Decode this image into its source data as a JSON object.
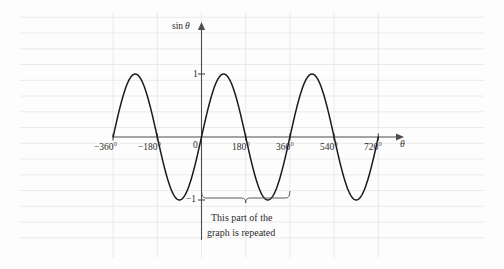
{
  "chart_data": {
    "type": "line",
    "title": "",
    "subtitle": "",
    "xlabel": "θ",
    "ylabel": "sin θ",
    "xlim": [
      -360,
      720
    ],
    "ylim": [
      -1,
      1
    ],
    "grid": true,
    "legend": null,
    "function": "y = sin(theta)",
    "amplitude": 1,
    "period_degrees": 360,
    "x_ticks": [
      -360,
      -180,
      0,
      180,
      360,
      540,
      720
    ],
    "x_tick_labels": [
      "−360°",
      "−180°",
      "0",
      "180°",
      "360°",
      "540°",
      "720°"
    ],
    "y_ticks": [
      1,
      -1
    ],
    "y_tick_labels": [
      "1",
      "−1"
    ],
    "series": [
      {
        "name": "sin θ",
        "color": "#1a1a1a",
        "x": [
          -360,
          -330,
          -300,
          -270,
          -240,
          -210,
          -180,
          -150,
          -120,
          -90,
          -60,
          -30,
          0,
          30,
          60,
          90,
          120,
          150,
          180,
          210,
          240,
          270,
          300,
          330,
          360,
          390,
          420,
          450,
          480,
          510,
          540,
          570,
          600,
          630,
          660,
          690,
          720
        ],
        "values": [
          0,
          0.5,
          0.866,
          1,
          0.866,
          0.5,
          0,
          -0.5,
          -0.866,
          -1,
          -0.866,
          -0.5,
          0,
          0.5,
          0.866,
          1,
          0.866,
          0.5,
          0,
          -0.5,
          -0.866,
          -1,
          -0.866,
          -0.5,
          0,
          0.5,
          0.866,
          1,
          0.866,
          0.5,
          0,
          -0.5,
          -0.866,
          -1,
          -0.866,
          -0.5,
          0
        ]
      }
    ],
    "annotations": [
      {
        "type": "brace",
        "text": "This part of the graph is repeated",
        "text_line1": "This part of the",
        "text_line2": "graph is repeated",
        "x_start": 0,
        "x_end": 360
      }
    ],
    "colors": {
      "curve": "#1a1a1a",
      "axis": "#4d4d4d",
      "grid": "#e0e0e0",
      "text": "#2b2b2b",
      "background": "#fdfdfd"
    }
  },
  "axes": {
    "y_axis_label": "sin θ",
    "y_axis_label_prefix": "sin",
    "y_axis_label_var": "θ",
    "x_axis_label": "θ",
    "tick_1": "1",
    "tick_neg1": "−1",
    "tick_origin": "0",
    "tick_neg360": "−360°",
    "tick_neg180": "−180°",
    "tick_180": "180°",
    "tick_360": "360°",
    "tick_540": "540°",
    "tick_720": "720°"
  },
  "annotation": {
    "line1": "This part of the",
    "line2": "graph is repeated"
  }
}
